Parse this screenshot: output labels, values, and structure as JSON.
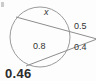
{
  "figure": {
    "title_visible": false,
    "background_color": "#fdfdfd",
    "stroke_color": "#8d8d8d",
    "text_color": "#333333",
    "answer_color": "#2b2b2b",
    "labels": {
      "chord_upper": "x",
      "chord_lower": "0.8",
      "external_upper": "0.5",
      "external_lower": "0.4"
    },
    "answer": "0.46",
    "geometry": {
      "shape": "circle",
      "circle_center_x": 40,
      "circle_center_y": 37,
      "circle_radius": 30,
      "vertex_x": 97,
      "vertex_y": 39,
      "upper_secant": {
        "far_point_x": 16,
        "far_point_y": 17,
        "near_point_x": 66,
        "near_point_y": 30
      },
      "lower_secant": {
        "far_point_x": 26,
        "far_point_y": 66,
        "near_point_x": 68,
        "near_point_y": 52
      }
    }
  }
}
